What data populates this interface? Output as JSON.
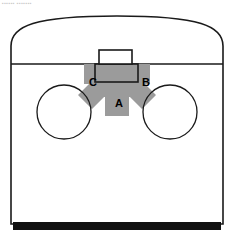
{
  "figure": {
    "watermark": "▪▪▪▪▪▪ ▪▪▪▪▪▪▪",
    "colors": {
      "outline": "#000000",
      "fill": "#ffffff",
      "arrow_gray": "#9b9b9b",
      "arrow_gray_dark": "#8e8e8e",
      "bottom_bar": "#111111",
      "label_text": "#000000",
      "watermark": "#c9c9c9"
    },
    "labels": [
      {
        "id": "A",
        "text": "A",
        "x": 119,
        "y": 107,
        "role": "downward-arrow-stem"
      },
      {
        "id": "B",
        "text": "B",
        "x": 146,
        "y": 86,
        "role": "right-wing"
      },
      {
        "id": "C",
        "text": "C",
        "x": 93,
        "y": 86,
        "role": "left-wing"
      }
    ],
    "shapes": {
      "body_outline": {
        "name": "dome-topped-enclosure",
        "left": 11,
        "right": 223,
        "top_arc_apex": 16,
        "shoulder_y": 64,
        "bottom": 224
      },
      "divider_line": {
        "name": "horizontal-divider",
        "y": 64,
        "x1": 11,
        "x2": 223
      },
      "circle_left": {
        "cx": 64,
        "cy": 112,
        "r": 27
      },
      "circle_right": {
        "cx": 170,
        "cy": 112,
        "r": 27
      },
      "top_rectangle": {
        "x": 99,
        "y": 50,
        "width": 33,
        "height": 14
      },
      "inner_rectangle": {
        "x": 95,
        "y": 64,
        "width": 43,
        "height": 18
      },
      "bottom_bar": {
        "x": 13,
        "y": 222,
        "width": 208,
        "height": 8
      }
    },
    "arrow": {
      "name": "three-pronged-arrow",
      "fill": "#9b9b9b",
      "direction": "downward-with-two-diagonal-wings",
      "stem": {
        "x": 105,
        "y": 82,
        "width": 23,
        "height": 34
      },
      "wing_left_tip": {
        "x": 80,
        "y": 98
      },
      "wing_right_tip": {
        "x": 153,
        "y": 98
      }
    }
  }
}
